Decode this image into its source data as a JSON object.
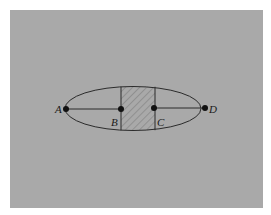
{
  "diagram": {
    "points": [
      {
        "id": "A",
        "label": "A"
      },
      {
        "id": "B",
        "label": "B"
      },
      {
        "id": "C",
        "label": "C"
      },
      {
        "id": "D",
        "label": "D"
      }
    ],
    "colors": {
      "panel": "#a9a9a9",
      "stroke": "#2b2b2b",
      "hatch": "#6e6e6e"
    }
  }
}
